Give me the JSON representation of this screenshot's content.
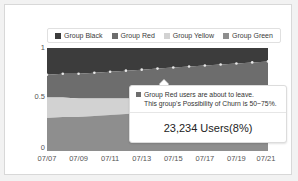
{
  "chart_data": {
    "type": "area",
    "title": "",
    "xlabel": "",
    "ylabel": "",
    "stacked": true,
    "normalized": true,
    "grid": false,
    "legend_position": "top",
    "ylim": [
      0,
      1
    ],
    "yticks": [
      "1",
      "0.5",
      "0"
    ],
    "ytick_values": [
      1,
      0.5,
      0
    ],
    "categories": [
      "07/07",
      "07/08",
      "07/09",
      "07/10",
      "07/11",
      "07/12",
      "07/13",
      "07/14",
      "07/15",
      "07/16",
      "07/17",
      "07/18",
      "07/19",
      "07/20",
      "07/21"
    ],
    "xticks": [
      "07/07",
      "07/09",
      "07/11",
      "07/13",
      "07/15",
      "07/17",
      "07/19",
      "07/21"
    ],
    "series": [
      {
        "name": "Group Black",
        "color": "#3c3c3c",
        "values": [
          0.26,
          0.25,
          0.25,
          0.24,
          0.23,
          0.22,
          0.21,
          0.2,
          0.19,
          0.18,
          0.17,
          0.16,
          0.15,
          0.14,
          0.13
        ]
      },
      {
        "name": "Group Red",
        "color": "#6d6d6d",
        "values": [
          0.22,
          0.23,
          0.24,
          0.25,
          0.26,
          0.27,
          0.28,
          0.29,
          0.3,
          0.31,
          0.32,
          0.33,
          0.34,
          0.35,
          0.36
        ]
      },
      {
        "name": "Group Yellow",
        "color": "#d2d2d2",
        "values": [
          0.2,
          0.19,
          0.18,
          0.17,
          0.16,
          0.15,
          0.14,
          0.13,
          0.12,
          0.12,
          0.11,
          0.11,
          0.1,
          0.1,
          0.09
        ]
      },
      {
        "name": "Group Green",
        "color": "#8e8e8e",
        "values": [
          0.32,
          0.33,
          0.33,
          0.34,
          0.35,
          0.36,
          0.37,
          0.38,
          0.39,
          0.39,
          0.4,
          0.4,
          0.41,
          0.41,
          0.42
        ]
      }
    ],
    "boundary_marker": {
      "name": "black-red-boundary",
      "style": "dotted-points",
      "color": "#e8e8e8"
    }
  },
  "legend": {
    "items": [
      {
        "label": "Group Black",
        "color": "#3c3c3c"
      },
      {
        "label": "Group Red",
        "color": "#6d6d6d"
      },
      {
        "label": "Group Yellow",
        "color": "#d2d2d2"
      },
      {
        "label": "Group Green",
        "color": "#8e8e8e"
      }
    ]
  },
  "tooltip": {
    "swatch_color": "#6d6d6d",
    "line1": "Group Red users are about to leave.",
    "line2": "This group's Possibility of Churn is 50~75%.",
    "total": "23,234 Users(8%)"
  }
}
